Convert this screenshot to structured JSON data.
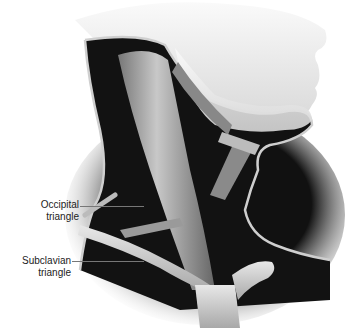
{
  "figure": {
    "labels": [
      {
        "id": "occipital",
        "line1": "Occipital",
        "line2": "triangle"
      },
      {
        "id": "subclavian",
        "line1": "Subclavian",
        "line2": "triangle"
      }
    ]
  }
}
